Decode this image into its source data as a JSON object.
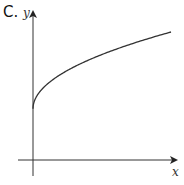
{
  "option_label": "C.",
  "chart_data": {
    "type": "line",
    "title": "",
    "xlabel": "x",
    "ylabel": "y",
    "function": "y = 2 + sqrt(x)",
    "xlim": [
      -1,
      10
    ],
    "ylim": [
      -1,
      7
    ],
    "grid": false,
    "ticks": false,
    "series": [
      {
        "name": "curve",
        "x": [
          0,
          0.05,
          0.25,
          0.5,
          1,
          2,
          3,
          4,
          5,
          6,
          7,
          8,
          9
        ],
        "y": [
          2,
          2.22,
          2.5,
          2.71,
          3,
          3.41,
          3.73,
          4,
          4.24,
          4.45,
          4.65,
          4.83,
          5
        ]
      }
    ]
  }
}
